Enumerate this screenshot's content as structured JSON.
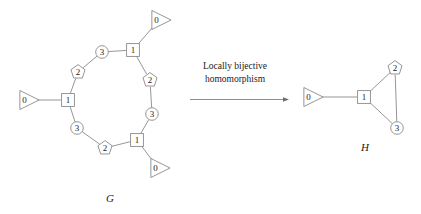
{
  "figure": {
    "background_color": "#ffffff",
    "line_color": "#8a8a8a",
    "text_color": "#1a1a1a",
    "caption_line1": "Locally bijective",
    "caption_line2": "homomorphism",
    "arrow": "right-arrow"
  },
  "graph_g": {
    "name": "G",
    "nodes": [
      {
        "id": "g_tri_left",
        "label": "0",
        "shape": "triangle",
        "x": 27,
        "y": 100
      },
      {
        "id": "g_sq_left",
        "label": "1",
        "shape": "square",
        "x": 68,
        "y": 100
      },
      {
        "id": "g_pent_tl",
        "label": "2",
        "shape": "pentagon",
        "x": 78,
        "y": 72
      },
      {
        "id": "g_circ_top",
        "label": "3",
        "shape": "circle",
        "x": 102,
        "y": 52
      },
      {
        "id": "g_sq_top",
        "label": "1",
        "shape": "square",
        "x": 133,
        "y": 50
      },
      {
        "id": "g_tri_top",
        "label": "0",
        "shape": "triangle",
        "x": 159,
        "y": 20
      },
      {
        "id": "g_pent_right",
        "label": "2",
        "shape": "pentagon",
        "x": 150,
        "y": 80
      },
      {
        "id": "g_circ_right",
        "label": "3",
        "shape": "circle",
        "x": 152,
        "y": 114
      },
      {
        "id": "g_sq_bottom",
        "label": "1",
        "shape": "square",
        "x": 137,
        "y": 140
      },
      {
        "id": "g_tri_bottom",
        "label": "0",
        "shape": "triangle",
        "x": 158,
        "y": 168
      },
      {
        "id": "g_pent_bl",
        "label": "2",
        "shape": "pentagon",
        "x": 105,
        "y": 148
      },
      {
        "id": "g_circ_bl",
        "label": "3",
        "shape": "circle",
        "x": 77,
        "y": 128
      }
    ],
    "edges": [
      [
        "g_tri_left",
        "g_sq_left"
      ],
      [
        "g_sq_left",
        "g_pent_tl"
      ],
      [
        "g_pent_tl",
        "g_circ_top"
      ],
      [
        "g_circ_top",
        "g_sq_top"
      ],
      [
        "g_sq_top",
        "g_tri_top"
      ],
      [
        "g_sq_top",
        "g_pent_right"
      ],
      [
        "g_pent_right",
        "g_circ_right"
      ],
      [
        "g_circ_right",
        "g_sq_bottom"
      ],
      [
        "g_sq_bottom",
        "g_tri_bottom"
      ],
      [
        "g_sq_bottom",
        "g_pent_bl"
      ],
      [
        "g_pent_bl",
        "g_circ_bl"
      ],
      [
        "g_circ_bl",
        "g_sq_left"
      ]
    ]
  },
  "graph_h": {
    "name": "H",
    "nodes": [
      {
        "id": "h_tri",
        "label": "0",
        "shape": "triangle",
        "x": 311,
        "y": 97
      },
      {
        "id": "h_sq",
        "label": "1",
        "shape": "square",
        "x": 364,
        "y": 97
      },
      {
        "id": "h_pent",
        "label": "2",
        "shape": "pentagon",
        "x": 395,
        "y": 68
      },
      {
        "id": "h_circ",
        "label": "3",
        "shape": "circle",
        "x": 397,
        "y": 128
      }
    ],
    "edges": [
      [
        "h_tri",
        "h_sq"
      ],
      [
        "h_sq",
        "h_pent"
      ],
      [
        "h_sq",
        "h_circ"
      ],
      [
        "h_pent",
        "h_circ"
      ]
    ]
  }
}
